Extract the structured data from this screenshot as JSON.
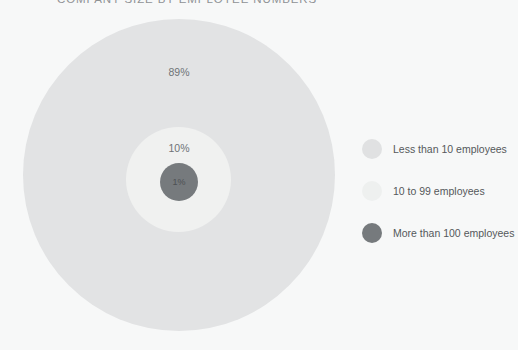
{
  "chart_data": {
    "type": "pie",
    "title": "COMPANY SIZE BY EMPLOYEE NUMBERS",
    "subtitle": "",
    "xlabel": "",
    "ylabel": "",
    "legend_position": "right",
    "grid": false,
    "categories": [
      "Less than 10 employees",
      "10 to 99 employees",
      "More than 100 employees"
    ],
    "values": [
      89,
      10,
      1
    ],
    "value_labels": [
      "89%",
      "10%",
      "1%"
    ],
    "colors": [
      "#e2e3e4",
      "#f0f1f0",
      "#767a7d"
    ],
    "series": [
      {
        "name": "Share of companies",
        "values": [
          89,
          10,
          1
        ]
      }
    ],
    "annotations": [
      "89%",
      "10%",
      "1%"
    ]
  },
  "title": {
    "text": "COMPANY SIZE BY EMPLOYEE NUMBERS"
  },
  "bubbles": [
    {
      "label": "89%",
      "category": "Less than 10 employees",
      "value": 89,
      "color": "#e2e3e4"
    },
    {
      "label": "10%",
      "category": "10 to 99 employees",
      "value": 10,
      "color": "#f0f1f0"
    },
    {
      "label": "1%",
      "category": "More than 100 employees",
      "value": 1,
      "color": "#767a7d"
    }
  ],
  "legend": {
    "items": [
      {
        "label": "Less than 10 employees",
        "swatch_color": "#e0e1e2",
        "swatch_icon": "circle-swatch-icon"
      },
      {
        "label": "10 to 99 employees",
        "swatch_color": "#eef0ef",
        "swatch_icon": "circle-swatch-icon"
      },
      {
        "label": "More than 100 employees",
        "swatch_color": "#767a7d",
        "swatch_icon": "circle-swatch-icon"
      }
    ]
  },
  "theme": {
    "background": "#f7f8f8",
    "text_color": "#55585b",
    "title_color": "#8f9295"
  }
}
